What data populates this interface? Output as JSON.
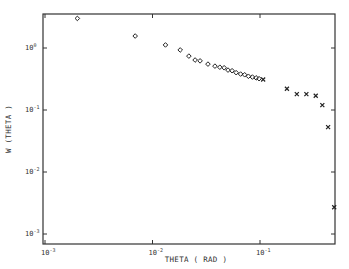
{
  "chart_data": {
    "type": "scatter",
    "title": "",
    "xlabel": "THETA ( RAD )",
    "ylabel": "W (THETA )",
    "xscale": "log",
    "yscale": "log",
    "xlim": [
      0.001,
      0.5
    ],
    "ylim": [
      0.00063,
      3.55
    ],
    "grid": false,
    "legend": null,
    "x_ticks": [
      {
        "value": 0.001,
        "base": "10",
        "exp": "-3"
      },
      {
        "value": 0.01,
        "base": "10",
        "exp": "-2"
      },
      {
        "value": 0.1,
        "base": "10",
        "exp": "-1"
      }
    ],
    "y_ticks": [
      {
        "value": 1,
        "base": "10",
        "exp": "0"
      },
      {
        "value": 0.1,
        "base": "10",
        "exp": "-1"
      },
      {
        "value": 0.01,
        "base": "10",
        "exp": "-2"
      },
      {
        "value": 0.001,
        "base": "10",
        "exp": "-3"
      }
    ],
    "series": [
      {
        "name": "diamonds",
        "marker": "diamond",
        "points": [
          [
            0.002,
            3.0
          ],
          [
            0.0069,
            1.56
          ],
          [
            0.0132,
            1.12
          ],
          [
            0.0181,
            0.93
          ],
          [
            0.0218,
            0.74
          ],
          [
            0.0249,
            0.64
          ],
          [
            0.0277,
            0.62
          ],
          [
            0.0328,
            0.55
          ],
          [
            0.0381,
            0.51
          ],
          [
            0.0423,
            0.49
          ],
          [
            0.0464,
            0.48
          ],
          [
            0.0504,
            0.44
          ],
          [
            0.055,
            0.43
          ],
          [
            0.06,
            0.4
          ],
          [
            0.066,
            0.38
          ],
          [
            0.072,
            0.37
          ],
          [
            0.078,
            0.35
          ],
          [
            0.085,
            0.34
          ],
          [
            0.092,
            0.33
          ],
          [
            0.098,
            0.32
          ]
        ]
      },
      {
        "name": "crosses",
        "marker": "x",
        "points": [
          [
            0.107,
            0.31
          ],
          [
            0.178,
            0.22
          ],
          [
            0.22,
            0.18
          ],
          [
            0.27,
            0.18
          ],
          [
            0.33,
            0.17
          ],
          [
            0.38,
            0.12
          ],
          [
            0.43,
            0.053
          ],
          [
            0.49,
            0.0027
          ]
        ]
      }
    ]
  }
}
